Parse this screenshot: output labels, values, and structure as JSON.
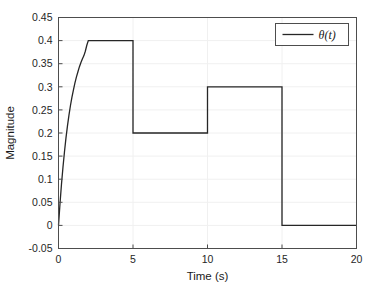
{
  "chart_data": {
    "type": "line",
    "title": "",
    "xlabel": "Time (s)",
    "ylabel": "Magnitude",
    "xlim": [
      0,
      20
    ],
    "ylim": [
      -0.05,
      0.45
    ],
    "xticks": [
      0,
      5,
      10,
      15,
      20
    ],
    "xtick_labels": [
      "0",
      "5",
      "10",
      "15",
      "20"
    ],
    "yticks": [
      -0.05,
      0,
      0.05,
      0.1,
      0.15,
      0.2,
      0.25,
      0.3,
      0.35,
      0.4,
      0.45
    ],
    "ytick_labels": [
      "-0.05",
      "0",
      "0.05",
      "0.1",
      "0.15",
      "0.2",
      "0.25",
      "0.3",
      "0.35",
      "0.4",
      "0.45"
    ],
    "grid": true,
    "legend_position": "upper right",
    "series": [
      {
        "name": "θ(t)",
        "color": "#262626",
        "line_width": 1.3,
        "description": "Saturating exponential rise from 0 to 0.4 over 0-2 s, hold at 0.4 until 5 s, step down to 0.2 until 10 s, step up to 0.3 until 15 s, step down to 0 until 20 s",
        "points": [
          [
            0.0,
            0.0
          ],
          [
            0.1,
            0.047
          ],
          [
            0.2,
            0.089
          ],
          [
            0.3,
            0.126
          ],
          [
            0.4,
            0.159
          ],
          [
            0.5,
            0.189
          ],
          [
            0.6,
            0.215
          ],
          [
            0.7,
            0.238
          ],
          [
            0.8,
            0.259
          ],
          [
            0.9,
            0.277
          ],
          [
            1.0,
            0.293
          ],
          [
            1.1,
            0.308
          ],
          [
            1.2,
            0.321
          ],
          [
            1.3,
            0.332
          ],
          [
            1.4,
            0.343
          ],
          [
            1.5,
            0.352
          ],
          [
            1.6,
            0.36
          ],
          [
            1.7,
            0.367
          ],
          [
            1.8,
            0.377
          ],
          [
            1.9,
            0.39
          ],
          [
            2.0,
            0.4
          ],
          [
            5.0,
            0.4
          ],
          [
            5.0,
            0.2
          ],
          [
            10.0,
            0.2
          ],
          [
            10.0,
            0.3
          ],
          [
            15.0,
            0.3
          ],
          [
            15.0,
            0.0
          ],
          [
            20.0,
            0.0
          ]
        ]
      }
    ]
  },
  "legend": {
    "entries": [
      {
        "label": "θ(t)",
        "color": "#262626"
      }
    ]
  },
  "axes": {
    "x_title": "Time (s)",
    "y_title": "Magnitude"
  },
  "colors": {
    "line": "#262626",
    "axis": "#4d4d4d",
    "grid": "#f0f0f0",
    "background": "#ffffff"
  }
}
